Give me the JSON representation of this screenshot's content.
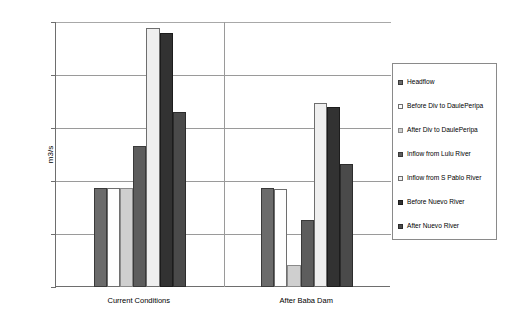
{
  "chart_data": {
    "type": "bar",
    "title": "",
    "xlabel": "",
    "ylabel": "m3/s",
    "ylim": [
      0,
      250
    ],
    "yticks": [
      0,
      50,
      100,
      150,
      200,
      250
    ],
    "grid": true,
    "legend_position": "right",
    "categories": [
      "Current Conditions",
      "After Baba Dam"
    ],
    "series": [
      {
        "name": "Headflow",
        "color": "#6b6b6b",
        "border": "#3a3a3a",
        "values": [
          93,
          93
        ]
      },
      {
        "name": "Before Div to DaulePeripa",
        "color": "#fdfdfd",
        "border": "#6e6e6e",
        "values": [
          93,
          92
        ]
      },
      {
        "name": "After Div to DaulePeripa",
        "color": "#cfcfcf",
        "border": "#8a8a8a",
        "values": [
          93,
          21
        ]
      },
      {
        "name": "Inflow from Lulu River",
        "color": "#5d5d5d",
        "border": "#3a3a3a",
        "values": [
          133,
          63
        ]
      },
      {
        "name": "Inflow from S Pablo River",
        "color": "#efefef",
        "border": "#6e6e6e",
        "values": [
          244,
          174
        ]
      },
      {
        "name": "Before Nuevo River",
        "color": "#323232",
        "border": "#1c1c1c",
        "values": [
          240,
          170
        ]
      },
      {
        "name": "After Nuevo River",
        "color": "#4a4a4a",
        "border": "#2c2c2c",
        "values": [
          165,
          116
        ]
      }
    ]
  },
  "axis": {
    "y_title": "m3/s",
    "y_tick_labels": [
      "250",
      "200",
      "150",
      "100",
      "50",
      "0"
    ]
  },
  "legend": {
    "items": [
      {
        "label": "Headflow"
      },
      {
        "label": "Before Div to DaulePeripa"
      },
      {
        "label": "After Div to DaulePeripa"
      },
      {
        "label": "Inflow from Lulu River"
      },
      {
        "label": "Inflow from S Pablo River"
      },
      {
        "label": "Before Nuevo River"
      },
      {
        "label": "After Nuevo River"
      }
    ]
  }
}
